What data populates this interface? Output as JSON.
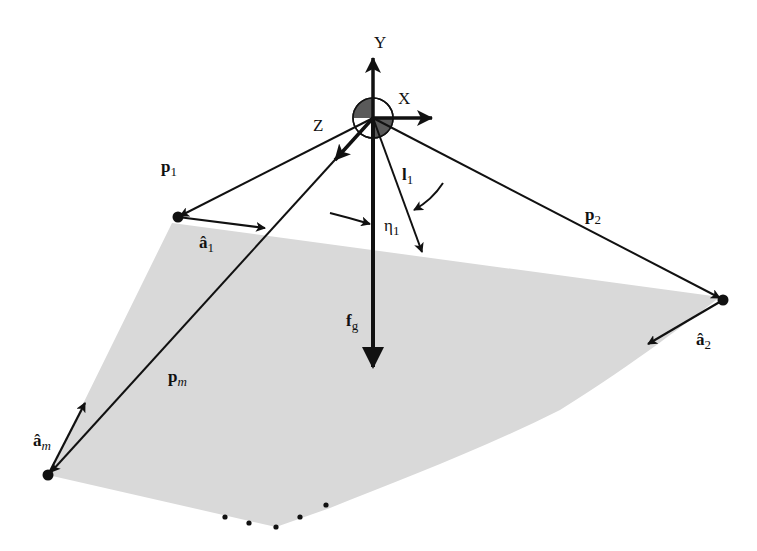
{
  "colors": {
    "background": "#ffffff",
    "plate_fill": "#d9d9d9",
    "line": "#111111",
    "origin_shade": "#5a5a5a"
  },
  "axes": {
    "y_label": "Y",
    "x_label": "X",
    "z_label": "Z"
  },
  "vectors": {
    "p1": {
      "base": "p",
      "sub": "1"
    },
    "p2": {
      "base": "p",
      "sub": "2"
    },
    "pm": {
      "base": "p",
      "sub": "m"
    },
    "a1": {
      "base": "â",
      "sub": "1"
    },
    "a2": {
      "base": "â",
      "sub": "2"
    },
    "am": {
      "base": "â",
      "sub": "m"
    },
    "l1": {
      "base": "l",
      "sub": "1"
    },
    "fg": {
      "base": "f",
      "sub": "g"
    }
  },
  "angles": {
    "eta1": {
      "base": "η",
      "sub": "1"
    }
  },
  "points": {
    "origin": [
      373,
      118
    ],
    "p1_end": [
      178,
      217
    ],
    "p2_end": [
      723,
      300
    ],
    "pm_end": [
      48,
      475
    ],
    "continuation_dots": [
      [
        225,
        517
      ],
      [
        249,
        523
      ],
      [
        276,
        527
      ],
      [
        300,
        517
      ],
      [
        326,
        505
      ]
    ]
  }
}
